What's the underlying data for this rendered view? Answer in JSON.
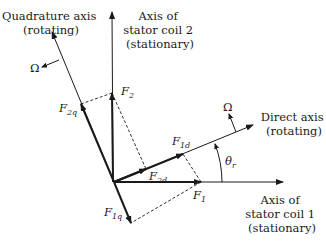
{
  "diagram": {
    "type": "phasor-diagram",
    "colors": {
      "line": "#1a1a1a",
      "background": "#ffffff"
    },
    "axes": {
      "stator_coil_1": {
        "line1": "Axis of",
        "line2": "stator coil 1",
        "line3": "(stationary)"
      },
      "stator_coil_2": {
        "line1": "Axis of",
        "line2": "stator coil 2",
        "line3": "(stationary)"
      },
      "direct": {
        "line1": "Direct axis",
        "line2": "(rotating)"
      },
      "quadrature": {
        "line1": "Quadrature axis",
        "line2": "(rotating)"
      }
    },
    "vectors": {
      "F1": {
        "main": "F",
        "sub": "1"
      },
      "F2": {
        "main": "F",
        "sub": "2"
      },
      "F1d": {
        "main": "F",
        "sub": "1d"
      },
      "F2d": {
        "main": "F",
        "sub": "2d"
      },
      "F1q": {
        "main": "F",
        "sub": "1q"
      },
      "F2q": {
        "main": "F",
        "sub": "2q"
      }
    },
    "omega_label": "Ω",
    "angle": {
      "main": "θ",
      "sub": "r"
    }
  }
}
